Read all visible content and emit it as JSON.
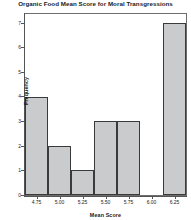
{
  "chart_data": {
    "type": "bar",
    "title": "Organic Food Mean Score for Moral Transgressions",
    "xlabel": "Mean Score",
    "ylabel": "Frequency",
    "categories": [
      "4.75",
      "5.00",
      "5.25",
      "5.50",
      "5.75",
      "6.00",
      "6.25"
    ],
    "values": [
      4,
      2,
      1,
      3,
      3,
      0,
      7
    ],
    "xticklabels": [
      "4.75",
      "5.00",
      "5.25",
      "5.50",
      "5.75",
      "6.00",
      "6.25"
    ],
    "yticklabels": [
      "0",
      "1",
      "2",
      "3",
      "4",
      "5",
      "6",
      "7"
    ],
    "ylim": [
      0,
      7.35
    ],
    "xlim": [
      4.625,
      6.375
    ],
    "grid": false,
    "legend": null,
    "bar_fill_color": "#c9cbcd",
    "bar_edge_color": "#3a3a3a",
    "axis_color": "#555555",
    "background_color": "#ffffff"
  }
}
